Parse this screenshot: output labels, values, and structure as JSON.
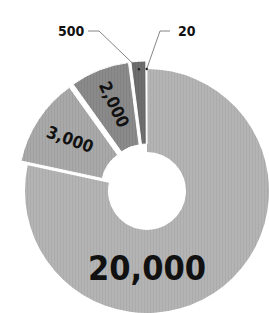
{
  "chart_data": {
    "type": "pie",
    "variant": "exploded-donut",
    "title": "",
    "categories": [
      "20,000",
      "3,000",
      "2,000",
      "500",
      "20"
    ],
    "values": [
      20000,
      3000,
      2000,
      500,
      20
    ],
    "colors": [
      "#b4b4b4",
      "#a9a9a9",
      "#8a8a8a",
      "#6e6e6e",
      "#555555"
    ],
    "labels": [
      "20,000",
      "3,000",
      "2,000",
      "500",
      "20"
    ],
    "outside_labels": [
      "500",
      "20"
    ],
    "legend": null,
    "start_angle_deg": 0,
    "direction": "clockwise"
  },
  "geometry": {
    "cx": 147,
    "cy": 191,
    "outer_r": 122,
    "inner_r": 39,
    "explode": 8
  }
}
